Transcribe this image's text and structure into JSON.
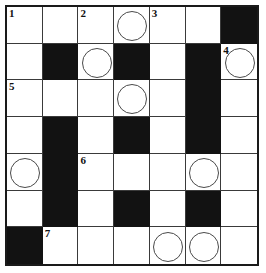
{
  "puzzle": {
    "title": "Crossword Grid",
    "rows": 7,
    "columns": 7,
    "colors": {
      "block": "#121212",
      "open": "#ffffff",
      "grid_line": "#3a3a3a",
      "frame": "#1a1a1a",
      "circle_stroke": "#4a4a4a",
      "number_text": "#111111",
      "page_background": "#ffffff"
    },
    "legend": {
      "block_symbol": "filled black square",
      "circle_symbol": "circled answer cell",
      "number_symbol": "clue start number"
    },
    "clue_numbers": [
      {
        "number": "1",
        "row": 0,
        "col": 0
      },
      {
        "number": "2",
        "row": 0,
        "col": 2
      },
      {
        "number": "3",
        "row": 0,
        "col": 4
      },
      {
        "number": "4",
        "row": 1,
        "col": 6
      },
      {
        "number": "5",
        "row": 2,
        "col": 0
      },
      {
        "number": "6",
        "row": 4,
        "col": 2
      },
      {
        "number": "7",
        "row": 6,
        "col": 1
      }
    ],
    "circled_cells": [
      {
        "row": 0,
        "col": 3
      },
      {
        "row": 1,
        "col": 2
      },
      {
        "row": 1,
        "col": 6
      },
      {
        "row": 2,
        "col": 3
      },
      {
        "row": 4,
        "col": 0
      },
      {
        "row": 4,
        "col": 5
      },
      {
        "row": 6,
        "col": 4
      },
      {
        "row": 6,
        "col": 5
      }
    ],
    "cells": [
      [
        {
          "block": false,
          "number": "1",
          "circle": false,
          "letter": ""
        },
        {
          "block": false,
          "number": "",
          "circle": false,
          "letter": ""
        },
        {
          "block": false,
          "number": "2",
          "circle": false,
          "letter": ""
        },
        {
          "block": false,
          "number": "",
          "circle": true,
          "letter": ""
        },
        {
          "block": false,
          "number": "3",
          "circle": false,
          "letter": ""
        },
        {
          "block": false,
          "number": "",
          "circle": false,
          "letter": ""
        },
        {
          "block": true,
          "number": "",
          "circle": false,
          "letter": ""
        }
      ],
      [
        {
          "block": false,
          "number": "",
          "circle": false,
          "letter": ""
        },
        {
          "block": true,
          "number": "",
          "circle": false,
          "letter": ""
        },
        {
          "block": false,
          "number": "",
          "circle": true,
          "letter": ""
        },
        {
          "block": true,
          "number": "",
          "circle": false,
          "letter": ""
        },
        {
          "block": false,
          "number": "",
          "circle": false,
          "letter": ""
        },
        {
          "block": true,
          "number": "",
          "circle": false,
          "letter": ""
        },
        {
          "block": false,
          "number": "4",
          "circle": true,
          "letter": ""
        }
      ],
      [
        {
          "block": false,
          "number": "5",
          "circle": false,
          "letter": ""
        },
        {
          "block": false,
          "number": "",
          "circle": false,
          "letter": ""
        },
        {
          "block": false,
          "number": "",
          "circle": false,
          "letter": ""
        },
        {
          "block": false,
          "number": "",
          "circle": true,
          "letter": ""
        },
        {
          "block": false,
          "number": "",
          "circle": false,
          "letter": ""
        },
        {
          "block": true,
          "number": "",
          "circle": false,
          "letter": ""
        },
        {
          "block": false,
          "number": "",
          "circle": false,
          "letter": ""
        }
      ],
      [
        {
          "block": false,
          "number": "",
          "circle": false,
          "letter": ""
        },
        {
          "block": true,
          "number": "",
          "circle": false,
          "letter": ""
        },
        {
          "block": false,
          "number": "",
          "circle": false,
          "letter": ""
        },
        {
          "block": true,
          "number": "",
          "circle": false,
          "letter": ""
        },
        {
          "block": false,
          "number": "",
          "circle": false,
          "letter": ""
        },
        {
          "block": true,
          "number": "",
          "circle": false,
          "letter": ""
        },
        {
          "block": false,
          "number": "",
          "circle": false,
          "letter": ""
        }
      ],
      [
        {
          "block": false,
          "number": "",
          "circle": true,
          "letter": ""
        },
        {
          "block": true,
          "number": "",
          "circle": false,
          "letter": ""
        },
        {
          "block": false,
          "number": "6",
          "circle": false,
          "letter": ""
        },
        {
          "block": false,
          "number": "",
          "circle": false,
          "letter": ""
        },
        {
          "block": false,
          "number": "",
          "circle": false,
          "letter": ""
        },
        {
          "block": false,
          "number": "",
          "circle": true,
          "letter": ""
        },
        {
          "block": false,
          "number": "",
          "circle": false,
          "letter": ""
        }
      ],
      [
        {
          "block": false,
          "number": "",
          "circle": false,
          "letter": ""
        },
        {
          "block": true,
          "number": "",
          "circle": false,
          "letter": ""
        },
        {
          "block": false,
          "number": "",
          "circle": false,
          "letter": ""
        },
        {
          "block": true,
          "number": "",
          "circle": false,
          "letter": ""
        },
        {
          "block": false,
          "number": "",
          "circle": false,
          "letter": ""
        },
        {
          "block": true,
          "number": "",
          "circle": false,
          "letter": ""
        },
        {
          "block": false,
          "number": "",
          "circle": false,
          "letter": ""
        }
      ],
      [
        {
          "block": true,
          "number": "",
          "circle": false,
          "letter": ""
        },
        {
          "block": false,
          "number": "7",
          "circle": false,
          "letter": ""
        },
        {
          "block": false,
          "number": "",
          "circle": false,
          "letter": ""
        },
        {
          "block": false,
          "number": "",
          "circle": false,
          "letter": ""
        },
        {
          "block": false,
          "number": "",
          "circle": true,
          "letter": ""
        },
        {
          "block": false,
          "number": "",
          "circle": true,
          "letter": ""
        },
        {
          "block": false,
          "number": "",
          "circle": false,
          "letter": ""
        }
      ]
    ]
  }
}
